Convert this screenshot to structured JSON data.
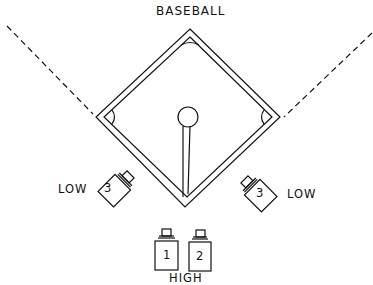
{
  "title": "BASEBALL",
  "cameras": [
    {
      "id": "left",
      "number": "3",
      "label": "LOW"
    },
    {
      "id": "right",
      "number": "3",
      "label": "LOW"
    },
    {
      "id": "high-1",
      "number": "1"
    },
    {
      "id": "high-2",
      "number": "2"
    }
  ],
  "high_label": "HIGH",
  "colors": {
    "line": "#111111",
    "background": "#ffffff"
  }
}
